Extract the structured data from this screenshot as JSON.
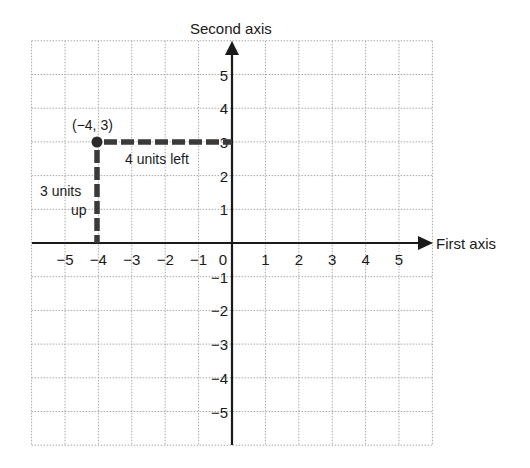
{
  "diagram": {
    "type": "coordinate-plane",
    "axes": {
      "x_label": "First axis",
      "y_label": "Second axis",
      "x_range": [
        -6,
        6
      ],
      "y_range": [
        -6,
        6
      ],
      "x_ticks": [
        "−5",
        "−4",
        "−3",
        "−2",
        "−1",
        "0",
        "1",
        "2",
        "3",
        "4",
        "5"
      ],
      "y_ticks_positive": [
        "1",
        "2",
        "3",
        "4",
        "5"
      ],
      "y_ticks_negative": [
        "−1",
        "−2",
        "−3",
        "−4",
        "−5"
      ]
    },
    "point": {
      "label": "(−4, 3)",
      "x": -4,
      "y": 3
    },
    "annotations": {
      "horizontal": "4 units left",
      "vertical_line1": "3 units",
      "vertical_line2": "up"
    },
    "colors": {
      "axis": "#1a1a1a",
      "grid": "#a8a8a8",
      "dash": "#3a3a3a",
      "background": "#ffffff"
    }
  }
}
